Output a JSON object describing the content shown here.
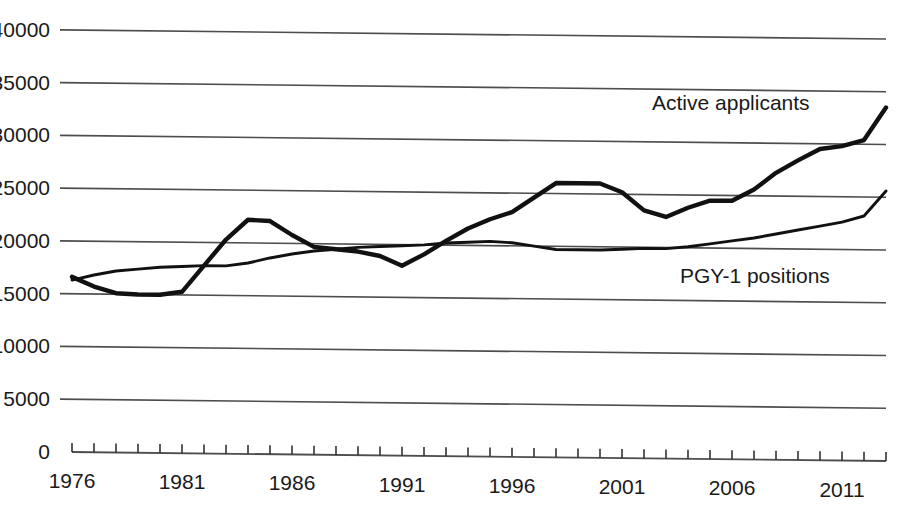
{
  "chart_data": {
    "type": "line",
    "title": "",
    "subtitle": "",
    "xlabel": "",
    "ylabel": "",
    "xlim": [
      1976,
      2013
    ],
    "ylim": [
      0,
      40000
    ],
    "grid": true,
    "legend_position": "inline-annotations",
    "y_ticks": [
      0,
      5000,
      10000,
      15000,
      20000,
      25000,
      30000,
      35000,
      40000
    ],
    "y_tick_labels": [
      "0",
      "5000",
      "10000",
      "15000",
      "20000",
      "25000",
      "30000",
      "35000",
      "40000"
    ],
    "x_ticks_labeled": [
      1976,
      1981,
      1986,
      1991,
      1996,
      2001,
      2006,
      2011
    ],
    "x_tick_labels": [
      "1976",
      "1981",
      "1986",
      "1991",
      "1996",
      "2001",
      "2006",
      "2011"
    ],
    "x_tick_interval": 1,
    "x": [
      1976,
      1977,
      1978,
      1979,
      1980,
      1981,
      1982,
      1983,
      1984,
      1985,
      1986,
      1987,
      1988,
      1989,
      1990,
      1991,
      1992,
      1993,
      1994,
      1995,
      1996,
      1997,
      1998,
      1999,
      2000,
      2001,
      2002,
      2003,
      2004,
      2005,
      2006,
      2007,
      2008,
      2009,
      2010,
      2011,
      2012,
      2013
    ],
    "series": [
      {
        "name": "Active applicants",
        "color": "#111111",
        "line_width": 4.4,
        "values": [
          16600,
          15700,
          15100,
          15000,
          15000,
          15300,
          17800,
          20300,
          22200,
          22100,
          20800,
          19700,
          19500,
          19300,
          18900,
          18000,
          19100,
          20400,
          21600,
          22500,
          23200,
          24600,
          26000,
          26000,
          26000,
          25200,
          23500,
          22900,
          23800,
          24500,
          24500,
          25600,
          27200,
          28400,
          29500,
          29800,
          30400,
          33500
        ]
      },
      {
        "name": "PGY-1 positions",
        "color": "#111111",
        "line_width": 2.9,
        "values": [
          16300,
          16800,
          17200,
          17400,
          17600,
          17700,
          17800,
          17800,
          18100,
          18600,
          19000,
          19300,
          19500,
          19700,
          19800,
          19900,
          20000,
          20200,
          20300,
          20400,
          20300,
          20000,
          19700,
          19700,
          19700,
          19800,
          19900,
          19900,
          20100,
          20400,
          20700,
          21000,
          21400,
          21800,
          22200,
          22600,
          23200,
          25600
        ]
      }
    ],
    "annotations": [
      {
        "text": "Active applicants",
        "x_px": 652,
        "y_px": 110
      },
      {
        "text": "PGY-1 positions",
        "x_px": 680,
        "y_px": 283
      }
    ]
  }
}
